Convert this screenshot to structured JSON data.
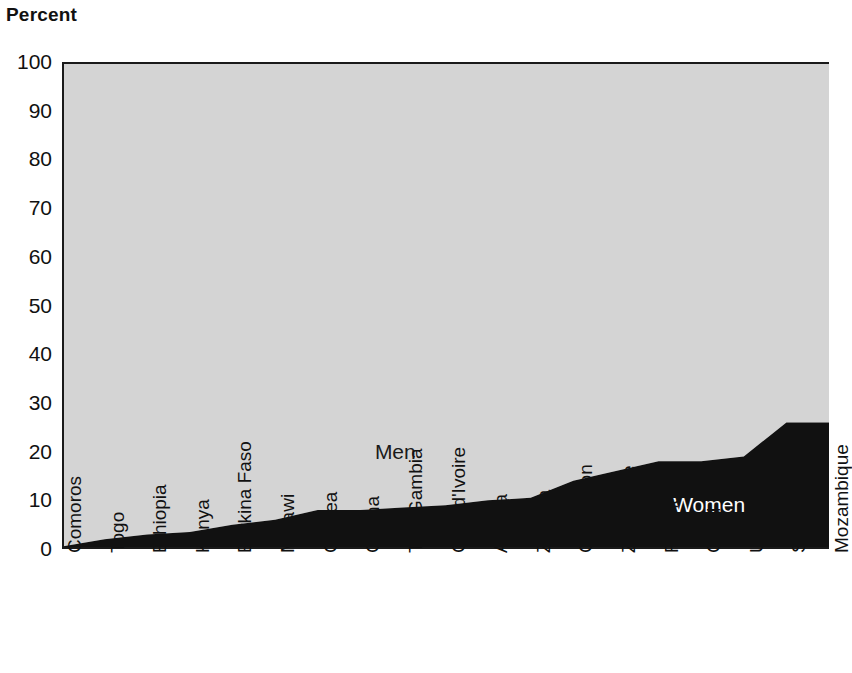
{
  "chart_data": {
    "type": "area",
    "stacked": true,
    "percent_stacked": true,
    "title": "",
    "subtitle": "",
    "xlabel": "",
    "ylabel": "Percent",
    "ylim": [
      0,
      100
    ],
    "yticks": [
      0,
      10,
      20,
      30,
      40,
      50,
      60,
      70,
      80,
      90,
      100
    ],
    "ytick_labels": [
      "0",
      "10",
      "20",
      "30",
      "40",
      "50",
      "60",
      "70",
      "80",
      "90",
      "100"
    ],
    "grid": false,
    "legend_position": "in-plot-annotations",
    "categories": [
      "Comoros",
      "Togo",
      "Ethiopia",
      "Kenya",
      "Burkina Faso",
      "Malawi",
      "Guinea",
      "Ghana",
      "The Gambia",
      "Côte d'Ivoire",
      "Angola",
      "Zambia",
      "Cameroon",
      "Zimbabwe",
      "Rwanda",
      "Chad",
      "Uganda",
      "South Africa",
      "Mozambique"
    ],
    "series": [
      {
        "name": "Women",
        "color": "#111111",
        "values": [
          0.5,
          2,
          3,
          3.5,
          5,
          6,
          8,
          8,
          8.5,
          9,
          10,
          10.5,
          14,
          16,
          18,
          18,
          19,
          26,
          26
        ]
      },
      {
        "name": "Men",
        "color": "#d4d4d4",
        "values": [
          99.5,
          98,
          97,
          96.5,
          95,
          94,
          92,
          92,
          91.5,
          91,
          90,
          89.5,
          86,
          84,
          82,
          82,
          81,
          74,
          74
        ]
      }
    ],
    "annotations": [
      {
        "text": "Men",
        "x_category": "The Gambia",
        "y_value": 20,
        "color": "#1a1a1a"
      },
      {
        "text": "Women",
        "x_category": "Chad",
        "y_value": 9,
        "color": "#ffffff"
      }
    ]
  },
  "axis": {
    "y_title": "Percent"
  },
  "colors": {
    "men_fill": "#d4d4d4",
    "women_fill": "#111111",
    "axis": "#1a1a1a",
    "background": "#ffffff"
  }
}
